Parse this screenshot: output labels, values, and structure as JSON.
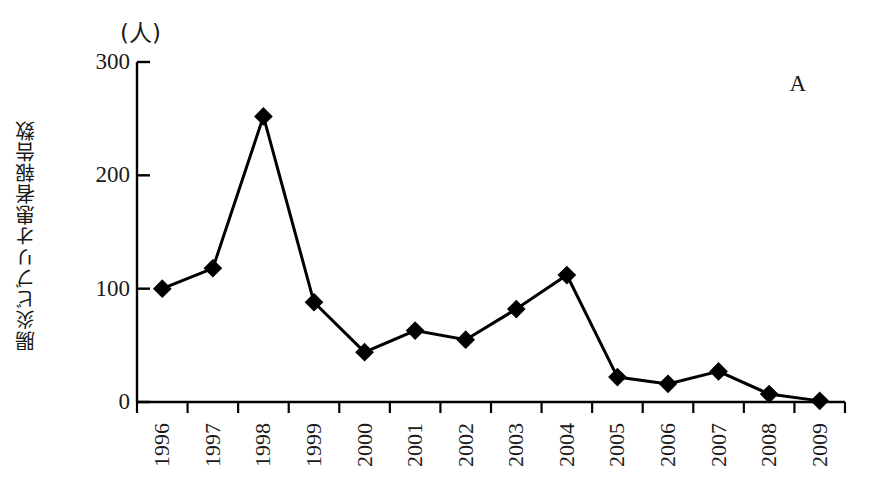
{
  "figure": {
    "panel_letter": "A",
    "unit_label": "(人)",
    "y_axis_title": "腸炎ビブリオ患者報告数"
  },
  "chart_data": {
    "type": "line",
    "title": "",
    "subtitle": "",
    "xlabel": "",
    "ylabel": "腸炎ビブリオ患者報告数",
    "unit": "(人)",
    "annotations": [
      "A"
    ],
    "grid": false,
    "legend": "none",
    "marker": "diamond",
    "line_color": "#000000",
    "marker_color": "#000000",
    "background_color": "#ffffff",
    "ylim": [
      0,
      300
    ],
    "yticks": [
      0,
      100,
      200,
      300
    ],
    "ytick_labels": [
      "0",
      "100",
      "200",
      "300"
    ],
    "categories": [
      "1996",
      "1997",
      "1998",
      "1999",
      "2000",
      "2001",
      "2002",
      "2003",
      "2004",
      "2005",
      "2006",
      "2007",
      "2008",
      "2009"
    ],
    "values": [
      100,
      118,
      252,
      88,
      44,
      63,
      55,
      82,
      112,
      22,
      16,
      27,
      7,
      1
    ]
  }
}
